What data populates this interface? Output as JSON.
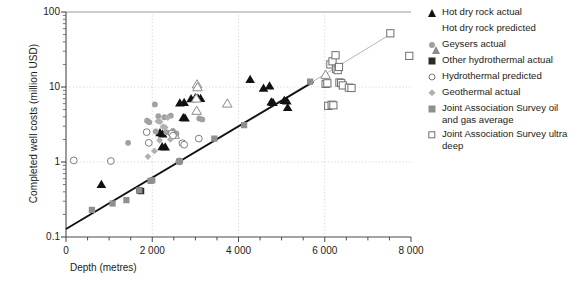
{
  "chart_data": {
    "type": "scatter",
    "title": "",
    "xlabel": "Depth (metres)",
    "ylabel": "Completed well costs (million  USD)",
    "xlim": [
      0,
      8000
    ],
    "ylim": [
      0.1,
      100
    ],
    "yscale": "log",
    "grid": true,
    "legend_position": "right",
    "xticklabels": [
      "0",
      "2 000",
      "4 000",
      "6 000",
      "8 000"
    ],
    "xtickvalues": [
      0,
      2000,
      4000,
      6000,
      8000
    ],
    "xminor_step": 500,
    "yticklabels": [
      "100",
      "10",
      "1",
      "0.1"
    ],
    "ytickvalues": [
      100,
      10,
      1,
      0.1
    ],
    "series": [
      {
        "name": "Hot dry rock actual",
        "marker": "triangle-filled",
        "color": "#111111",
        "points": [
          [
            820,
            0.5
          ],
          [
            2180,
            2.45
          ],
          [
            2240,
            2.35
          ],
          [
            2230,
            1.6
          ],
          [
            2300,
            1.58
          ],
          [
            2640,
            6.1
          ],
          [
            2740,
            6.2
          ],
          [
            2720,
            3.9
          ],
          [
            2760,
            3.85
          ],
          [
            3000,
            7.2
          ],
          [
            3060,
            7.1
          ],
          [
            3120,
            7.0
          ],
          [
            2900,
            6.95
          ],
          [
            4270,
            12.6
          ],
          [
            4580,
            9.6
          ],
          [
            4720,
            10.3
          ],
          [
            4760,
            6.3
          ],
          [
            4800,
            6.2
          ],
          [
            5060,
            6.6
          ],
          [
            5120,
            6.5
          ],
          [
            5140,
            5.3
          ]
        ]
      },
      {
        "name": "Hot dry rock predicted",
        "marker": "triangle-open",
        "color": "#8c8c8c",
        "points": [
          [
            3040,
            10.8
          ],
          [
            3050,
            9.9
          ],
          [
            3020,
            7.0
          ],
          [
            3030,
            4.8
          ],
          [
            3740,
            6.0
          ],
          [
            6020,
            14.5
          ],
          [
            2520,
            2.3
          ]
        ]
      },
      {
        "name": "Geysers actual",
        "marker": "circle-filled",
        "color": "#a0a0a0",
        "points": [
          [
            1440,
            1.8
          ],
          [
            1880,
            3.55
          ],
          [
            1930,
            3.4
          ],
          [
            2060,
            5.85
          ],
          [
            2140,
            4.1
          ],
          [
            2280,
            3.95
          ],
          [
            2330,
            2.5
          ],
          [
            2430,
            4.15
          ],
          [
            2480,
            2.6
          ],
          [
            2560,
            2.4
          ],
          [
            3090,
            3.8
          ],
          [
            3160,
            3.7
          ],
          [
            2080,
            2.55
          ]
        ]
      },
      {
        "name": "Other hydrothermal actual",
        "marker": "square-dark",
        "color": "#2b2b2b",
        "points": [
          [
            1700,
            0.42
          ],
          [
            1740,
            0.41
          ],
          [
            4780,
            0.0
          ],
          [
            3440,
            0.0
          ]
        ]
      },
      {
        "name": "Hydrothermal predicted",
        "marker": "circle-open",
        "color": "#7d7d7d",
        "points": [
          [
            180,
            1.05
          ],
          [
            1040,
            1.03
          ],
          [
            1870,
            2.5
          ],
          [
            1920,
            1.8
          ],
          [
            2450,
            2.4
          ],
          [
            2480,
            2.25
          ],
          [
            2700,
            1.78
          ],
          [
            2740,
            1.7
          ],
          [
            3080,
            2.05
          ],
          [
            2630,
            1.02
          ]
        ]
      },
      {
        "name": "Geothermal actual",
        "marker": "diamond",
        "color": "#b0b0b0",
        "points": [
          [
            1900,
            1.18
          ],
          [
            2130,
            3.5
          ],
          [
            2180,
            3.45
          ],
          [
            2250,
            2.95
          ],
          [
            2300,
            2.9
          ],
          [
            2360,
            3.9
          ],
          [
            2420,
            2.0
          ],
          [
            2170,
            1.95
          ],
          [
            2050,
            1.4
          ]
        ]
      },
      {
        "name": "Joint Association Survey oil and gas average",
        "marker": "square-grey",
        "color": "#8f8f8f",
        "points": [
          [
            600,
            0.23
          ],
          [
            1080,
            0.28
          ],
          [
            1400,
            0.31
          ],
          [
            1700,
            0.42
          ],
          [
            1960,
            0.56
          ],
          [
            2000,
            0.57
          ],
          [
            2630,
            1.02
          ],
          [
            3440,
            2.05
          ],
          [
            4130,
            3.1
          ],
          [
            5660,
            11.8
          ],
          [
            6040,
            11.0
          ]
        ]
      },
      {
        "name": "Joint Association Survey ultra deep",
        "marker": "square-open",
        "color": "#6f6f6f",
        "points": [
          [
            6020,
            11.0
          ],
          [
            6060,
            11.2
          ],
          [
            6080,
            5.6
          ],
          [
            6160,
            5.8
          ],
          [
            6200,
            5.7
          ],
          [
            6130,
            20.0
          ],
          [
            6180,
            22.0
          ],
          [
            6250,
            26.5
          ],
          [
            6260,
            17.5
          ],
          [
            6300,
            16.8
          ],
          [
            6330,
            18.5
          ],
          [
            6340,
            11.5
          ],
          [
            6380,
            11.3
          ],
          [
            6420,
            10.5
          ],
          [
            6560,
            9.8
          ],
          [
            6620,
            9.7
          ],
          [
            7520,
            52.0
          ],
          [
            7960,
            26.0
          ]
        ]
      }
    ],
    "trendlines": [
      {
        "name": "oil-and-gas-fit",
        "color": "#111111",
        "from": [
          0,
          0.128
        ],
        "to": [
          5740,
          11.8
        ]
      },
      {
        "name": "ultra-deep-fit",
        "color": "#b5b5b5",
        "from": [
          5700,
          11.6
        ],
        "to": [
          7560,
          52.0
        ]
      }
    ]
  },
  "axes": {
    "y_title": "Completed well costs (million  USD)",
    "x_title": "Depth (metres)",
    "y_ticks": [
      {
        "label": "100"
      },
      {
        "label": "10"
      },
      {
        "label": "1"
      },
      {
        "label": "0.1"
      }
    ],
    "x_ticks": [
      {
        "label": "0"
      },
      {
        "label": "2 000"
      },
      {
        "label": "4 000"
      },
      {
        "label": "6 000"
      },
      {
        "label": "8 000"
      }
    ]
  },
  "legend": {
    "items": [
      {
        "label": "Hot dry rock actual",
        "marker": "triangle-filled"
      },
      {
        "label": "Hot dry rock predicted",
        "marker": "triangle-open"
      },
      {
        "label": "Geysers actual",
        "marker": "circle-filled"
      },
      {
        "label": "Other hydrothermal actual",
        "marker": "square-dark"
      },
      {
        "label": "Hydrothermal predicted",
        "marker": "circle-open"
      },
      {
        "label": "Geothermal actual",
        "marker": "diamond"
      },
      {
        "label": "Joint Association Survey oil and gas average",
        "marker": "square-grey"
      },
      {
        "label": "Joint Association Survey ultra deep",
        "marker": "square-open"
      }
    ]
  }
}
